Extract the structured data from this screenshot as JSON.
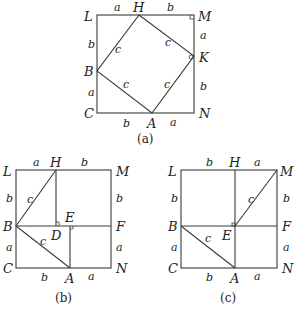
{
  "figures": [
    {
      "id": "a",
      "caption": "(a)",
      "points": {
        "L": "L",
        "H": "H",
        "M": "M",
        "K": "K",
        "B": "B",
        "C": "C",
        "A": "A",
        "N": "N"
      },
      "sides": {
        "LH": "a",
        "HM": "b",
        "LB": "b",
        "BC": "a",
        "MK": "a",
        "KN": "b",
        "CA": "b",
        "AN": "a",
        "BH": "c",
        "HK": "c",
        "BA": "c",
        "AK": "c"
      }
    },
    {
      "id": "b",
      "caption": "(b)",
      "points": {
        "L": "L",
        "H": "H",
        "M": "M",
        "B": "B",
        "D": "D",
        "E": "E",
        "F": "F",
        "C": "C",
        "A": "A",
        "N": "N"
      },
      "sides": {
        "LH": "a",
        "HM": "b",
        "LB": "b",
        "BC": "a",
        "MF": "b",
        "FN": "a",
        "CA": "b",
        "AN": "a",
        "BH": "c",
        "BA": "c"
      }
    },
    {
      "id": "c",
      "caption": "(c)",
      "points": {
        "L": "L",
        "H": "H",
        "M": "M",
        "B": "B",
        "E": "E",
        "F": "F",
        "C": "C",
        "A": "A",
        "N": "N"
      },
      "sides": {
        "LH": "b",
        "HM": "a",
        "LB": "b",
        "BC": "a",
        "MF": "b",
        "FN": "a",
        "CA": "b",
        "AN": "a",
        "EM": "c",
        "BA": "c"
      }
    }
  ]
}
